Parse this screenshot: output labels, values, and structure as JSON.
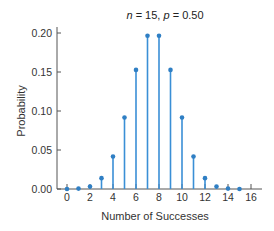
{
  "chart_data": {
    "type": "stem",
    "title": "n = 15, p = 0.50",
    "title_parts": {
      "n_label": "n",
      "n_value": "15",
      "p_label": "p",
      "p_value": "0.50"
    },
    "xlabel": "Number of Successes",
    "ylabel": "Probability",
    "x": [
      0,
      1,
      2,
      3,
      4,
      5,
      6,
      7,
      8,
      9,
      10,
      11,
      12,
      13,
      14,
      15
    ],
    "values": [
      0.0,
      0.0005,
      0.0032,
      0.0139,
      0.0417,
      0.0916,
      0.1527,
      0.1964,
      0.1964,
      0.1527,
      0.0916,
      0.0417,
      0.0139,
      0.0032,
      0.0005,
      0.0
    ],
    "xticks": [
      0,
      2,
      4,
      6,
      8,
      10,
      12,
      14,
      16
    ],
    "yticks": [
      "0.00",
      "0.05",
      "0.10",
      "0.15",
      "0.20"
    ],
    "xlim": [
      0,
      16
    ],
    "ylim": [
      0,
      0.2
    ],
    "grid": false,
    "legend": null
  },
  "colors": {
    "stem": "#3a8fd6",
    "marker": "#2f7fc4",
    "axis": "#555555"
  }
}
